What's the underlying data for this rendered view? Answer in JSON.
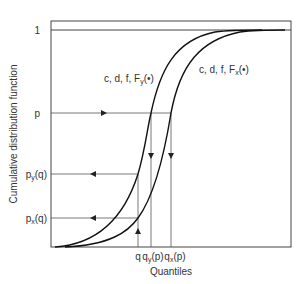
{
  "diagram": {
    "ylabel": "Cumulative distribution function",
    "xlabel": "Quantiles",
    "y_ticks": {
      "one": "1",
      "p": "p",
      "py_q": {
        "base": "p",
        "sub": "y",
        "tail": "(q)"
      },
      "px_q": {
        "base": "p",
        "sub": "x",
        "tail": "(q)"
      }
    },
    "x_ticks": {
      "q": "q",
      "qy_p": {
        "base": "q",
        "sub": "y",
        "tail": "(p)"
      },
      "qx_p": {
        "base": "q",
        "sub": "x",
        "tail": "(p)"
      }
    },
    "curves": {
      "y": {
        "prefix": "c, d, f, F",
        "sub": "y",
        "tail": "(•)"
      },
      "x": {
        "prefix": "c, d, f, F",
        "sub": "x",
        "tail": "(•)"
      }
    }
  }
}
